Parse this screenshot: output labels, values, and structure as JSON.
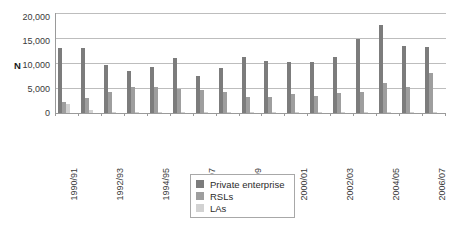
{
  "chart_data": {
    "type": "bar",
    "title": "",
    "subtitle": "",
    "xlabel": "",
    "ylabel": "N",
    "ylim": [
      0,
      20000
    ],
    "ytick_labels": [
      "20,000",
      "15,000",
      "10,000",
      "5,000",
      "0"
    ],
    "ytick_values": [
      20000,
      15000,
      10000,
      5000,
      0
    ],
    "grid": true,
    "legend_position": "bottom-center",
    "categories": [
      "1990/91",
      "1991/92",
      "1992/93",
      "1993/94",
      "1994/95",
      "1995/96",
      "1996/97",
      "1997/98",
      "1998/99",
      "1999/00",
      "2000/01",
      "2001/02",
      "2002/03",
      "2003/04",
      "2004/05",
      "2005/06",
      "2006/07"
    ],
    "visible_tick_labels": [
      "1990/91",
      "1992/93",
      "1994/95",
      "1996/97",
      "1998/99",
      "2000/01",
      "2002/03",
      "2004/05",
      "2006/07"
    ],
    "series": [
      {
        "name": "Private enterprise",
        "color": "#7c7c7c",
        "values": [
          13000,
          13050,
          9600,
          8500,
          9200,
          11000,
          7400,
          9000,
          11200,
          10400,
          10200,
          10200,
          11200,
          14900,
          17700,
          13500,
          13300
        ]
      },
      {
        "name": "RSLs",
        "color": "#9e9e9e",
        "values": [
          2200,
          2950,
          4200,
          5300,
          5150,
          4800,
          4650,
          4250,
          3250,
          3200,
          3900,
          3400,
          4000,
          4150,
          6100,
          5150,
          8100
        ]
      },
      {
        "name": "LAs",
        "color": "#d2d2d2",
        "values": [
          1750,
          550,
          180,
          150,
          120,
          100,
          80,
          60,
          50,
          40,
          40,
          30,
          30,
          30,
          60,
          60,
          80
        ]
      }
    ]
  },
  "legend": {
    "items": [
      {
        "label": "Private enterprise",
        "color": "#7c7c7c"
      },
      {
        "label": "RSLs",
        "color": "#9e9e9e"
      },
      {
        "label": "LAs",
        "color": "#d2d2d2"
      }
    ]
  },
  "axis": {
    "y_title": "N"
  }
}
